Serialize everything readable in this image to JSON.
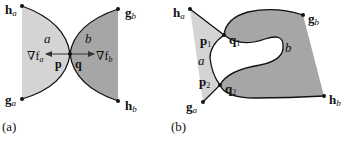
{
  "colors": {
    "region_a": "#d4d4d4",
    "region_b": "#a6a6a6",
    "stroke": "#111111",
    "background": "#ffffff"
  },
  "panel_a": {
    "caption": "(a)",
    "labels": {
      "h_a": "h",
      "h_a_sub": "a",
      "g_a": "g",
      "g_a_sub": "a",
      "g_b": "g",
      "g_b_sub": "b",
      "h_b": "h",
      "h_b_sub": "b",
      "region_a": "a",
      "region_b": "b",
      "p": "p",
      "q": "q",
      "grad_a": "∇f",
      "grad_a_sub": "a",
      "grad_b": "∇f",
      "grad_b_sub": "b"
    }
  },
  "panel_b": {
    "caption": "(b)",
    "labels": {
      "h_a": "h",
      "h_a_sub": "a",
      "g_a": "g",
      "g_a_sub": "a",
      "g_b": "g",
      "g_b_sub": "b",
      "h_b": "h",
      "h_b_sub": "b",
      "region_a": "a",
      "region_b": "b",
      "p1": "p",
      "p1_sub": "1",
      "p2": "p",
      "p2_sub": "2",
      "q1": "q",
      "q1_sub": "1",
      "q2": "q",
      "q2_sub": "2"
    }
  }
}
